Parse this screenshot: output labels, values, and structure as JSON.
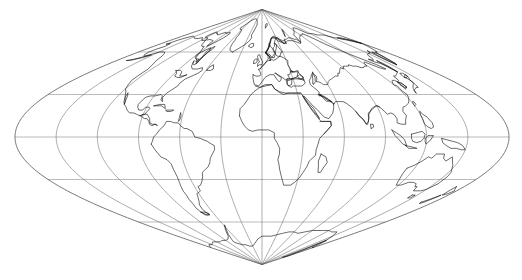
{
  "figure": {
    "background_color": "#ffffff",
    "width": 522,
    "height": 280
  },
  "chart_data": {
    "type": "map",
    "projection": "sinusoidal",
    "central_meridian_deg": 0,
    "graticule": {
      "grid_on": true,
      "meridian_interval_deg": 30,
      "parallel_interval_deg": 30,
      "meridian_ticks_deg": [
        -180,
        -150,
        -120,
        -90,
        -60,
        -30,
        0,
        30,
        60,
        90,
        120,
        150,
        180
      ],
      "parallel_ticks_deg": [
        -60,
        -30,
        0,
        30,
        60
      ],
      "meridian_color": "#777777",
      "parallel_color": "#8a8a8a",
      "outline_color": "#555555"
    },
    "coastline_color": "#111111",
    "lat_range_deg": [
      -90,
      90
    ],
    "lon_range_deg": [
      -180,
      180
    ],
    "pixel_geometry": {
      "center_x": 262,
      "equator_y": 137,
      "north_pole_y": 8,
      "south_pole_y": 263,
      "half_width_px": 247,
      "degrees_per_px_y": 1.4,
      "degrees_per_px_x": 1.4
    },
    "features": [
      "North America",
      "South America",
      "Europe",
      "Africa",
      "Asia",
      "Australia",
      "Antarctica",
      "Greenland",
      "Madagascar",
      "New Zealand",
      "Japan",
      "Indonesia",
      "British Isles",
      "Caribbean islands"
    ]
  },
  "map": {
    "label": "world-coastline-map",
    "alt_text": "Outline world map with graticule on a sinusoidal projection"
  }
}
